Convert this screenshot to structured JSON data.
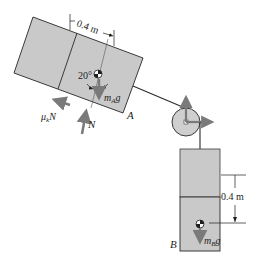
{
  "diagram": {
    "colors": {
      "block_fill": "#c9c9c9",
      "block_stroke": "#3a3a3a",
      "arrow": "#7a7a7a",
      "rope": "#2a2a2a",
      "pulley_fill": "#cfcfcf"
    },
    "block_a": {
      "label": "A",
      "dimension_label": "0.4 m",
      "angle_label": "20°",
      "weight_label_main": "m",
      "weight_label_sub": "A",
      "weight_label_tail": "g",
      "friction_label_main": "μ",
      "friction_label_sub": "k",
      "friction_label_tail": "N",
      "normal_label": "N"
    },
    "block_b": {
      "label": "B",
      "dimension_label": "0.4 m",
      "weight_label_main": "m",
      "weight_label_sub": "B",
      "weight_label_tail": "g"
    },
    "pulley": {
      "reaction_arrows": [
        "vertical-up",
        "horizontal-right"
      ]
    }
  }
}
